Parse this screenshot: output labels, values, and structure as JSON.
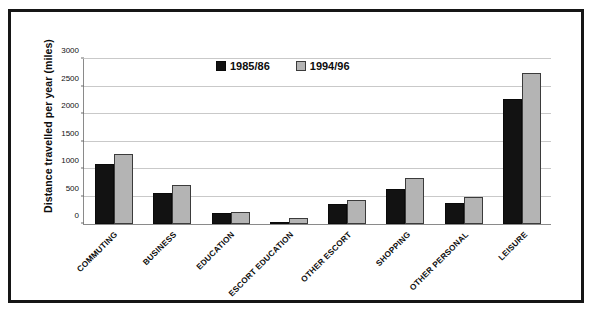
{
  "chart_data": {
    "type": "bar",
    "title": "",
    "subtitle": "",
    "xlabel": "",
    "ylabel": "Distance travelled per year (miles)",
    "ylim": [
      0,
      3000
    ],
    "ytick_values": [
      0,
      500,
      1000,
      1500,
      2000,
      2500,
      3000
    ],
    "ytick_labels": [
      "0",
      "500",
      "1000",
      "1500",
      "2000",
      "2500",
      "3000"
    ],
    "grid": "horizontal",
    "legend_position": "top-center",
    "categories": [
      "COMMUTING",
      "BUSINESS",
      "EDUCATION",
      "ESCORT EDUCATION",
      "OTHER ESCORT",
      "SHOPPING",
      "OTHER PERSONAL",
      "LEISURE"
    ],
    "series": [
      {
        "name": "1985/86",
        "color": "#121212",
        "values": [
          1100,
          570,
          200,
          40,
          370,
          640,
          380,
          2280
        ]
      },
      {
        "name": "1994/96",
        "color": "#b4b4b4",
        "values": [
          1280,
          715,
          220,
          110,
          440,
          830,
          500,
          2750
        ]
      }
    ]
  }
}
